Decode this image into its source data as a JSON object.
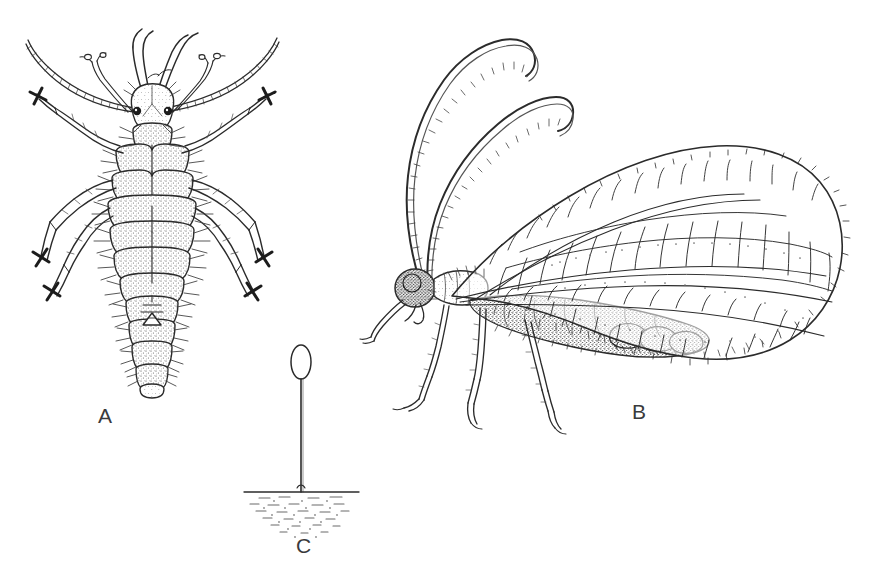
{
  "figure": {
    "kind": "scientific-illustration",
    "background_color": "#ffffff",
    "ink_color": "#2b2b2b",
    "label_color": "#3a3a3c",
    "width": 886,
    "height": 575
  },
  "panels": [
    {
      "id": "A",
      "label": "A",
      "name": "larva-dorsal-view",
      "description": "Lacewing larva (aphid lion), dorsal view, with long curved sickle mandibles, segmented antennae, six legs ending in cross-shaped tarsal claws, and a stippled bristly abdomen",
      "label_x": 98,
      "label_y": 404
    },
    {
      "id": "B",
      "label": "B",
      "name": "adult-lateral-view",
      "description": "Adult lacewing, lateral view, with two long beaded antennae curving forward, a large net-veined wing covering the stippled abdomen, and three pairs of legs",
      "label_x": 632,
      "label_y": 400
    },
    {
      "id": "C",
      "label": "C",
      "name": "stalked-egg-on-substrate",
      "description": "Single ovoid lacewing egg borne on a long slender silken stalk rising from a hatched substrate surface",
      "label_x": 296,
      "label_y": 534
    }
  ],
  "panel_a_detail": {
    "body_segments": 9,
    "leg_pairs": 3,
    "mandible_pairs": 1,
    "antenna_pairs": 1,
    "palp_pairs": 1,
    "eye_spots": 2,
    "tarsal_claw_shape": "cross"
  },
  "panel_b_detail": {
    "antennae": 2,
    "wing_count": 1,
    "leg_pairs": 3,
    "wing_margin": "fringed",
    "wing_cells_visible": "many polygonal cells"
  },
  "panel_c_detail": {
    "egg_shape": "ovoid",
    "stalk": "slender vertical",
    "substrate": "horizontal line with stipple hatching below"
  }
}
